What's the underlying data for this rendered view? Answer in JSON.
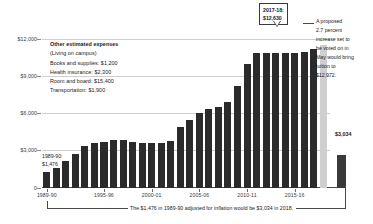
{
  "chart_data": {
    "type": "bar",
    "title": "",
    "xlabel": "",
    "ylabel": "",
    "ylim": [
      0,
      13500
    ],
    "grid": true,
    "legend_position": "none",
    "ytick_labels": [
      "0",
      "$3,000",
      "$6,000",
      "$9,000",
      "$12,000"
    ],
    "ytick_values": [
      0,
      3000,
      6000,
      9000,
      12000
    ],
    "xtick_labels": [
      "1989-90",
      "1995-96",
      "2000-01",
      "2005-06",
      "2010-11",
      "2015-16"
    ],
    "xtick_categories": [
      "1989-90",
      "1995-96",
      "2000-01",
      "2005-06",
      "2010-11",
      "2015-16"
    ],
    "categories": [
      "1989-90",
      "1990-91",
      "1991-92",
      "1992-93",
      "1993-94",
      "1994-95",
      "1995-96",
      "1996-97",
      "1997-98",
      "1998-99",
      "1999-00",
      "2000-01",
      "2001-02",
      "2002-03",
      "2003-04",
      "2004-05",
      "2005-06",
      "2006-07",
      "2007-08",
      "2008-09",
      "2009-10",
      "2010-11",
      "2011-12",
      "2012-13",
      "2013-14",
      "2014-15",
      "2015-16",
      "2016-17",
      "2017-18"
    ],
    "values": [
      1476,
      1820,
      2486,
      3044,
      3799,
      4111,
      4139,
      4354,
      4354,
      4212,
      4037,
      4047,
      4047,
      4282,
      5530,
      6141,
      6802,
      7143,
      7347,
      7788,
      9285,
      11279,
      12192,
      12192,
      12192,
      12192,
      12240,
      12294,
      12630
    ],
    "series_note": "University tuition and fees by academic year",
    "highlight_last": {
      "label_year": "2017-18",
      "label_value": "$12,630",
      "callout_text": "2017-18:\n$12,630"
    },
    "inflation_bar": {
      "label": "$3,034",
      "value": 3034,
      "description": "1989-90 tuition adjusted for inflation"
    },
    "proposed_bar": {
      "value": 12972,
      "shade": "#cfcfcf"
    },
    "annotations": [
      "A proposed 2.7 percent increase set to be voted on in May would bring tuition to $12,972.",
      "The $1,476 in 1989-90 adjusted for inflation would be $3,034 in 2018."
    ]
  },
  "callout": {
    "line1": "2017-18:",
    "line2": "$12,630"
  },
  "right_annotation": {
    "line1": "A proposed",
    "line2": "2.7 percent",
    "line3": "increase set to",
    "line4": "be voted on in",
    "line5": "May would bring",
    "line6": "tuition to",
    "line7": "$12,972."
  },
  "expenses_note": {
    "heading": "Other estimated expenses",
    "subheading": "(Living on campus)",
    "line1": "Books and supplies: $1,200",
    "line2": "Health insurance: $2,300",
    "line3": "Room and board: $15,400",
    "line4": "Transportation: $1,900"
  },
  "first_bar_label": {
    "line1": "1989-90:",
    "line2": "$1,476"
  },
  "inflation_label": {
    "value": "$3,034"
  },
  "footnote": {
    "text": "The $1,476 in 1989-90 adjusted for inflation would be $3,034 in 2018."
  },
  "colors": {
    "bar": "#2b2b2b",
    "proposed_bar": "#cfcfcf",
    "gridline": "#cfcfcf",
    "axis": "#4a4a4a",
    "text": "#1a1a1a",
    "background": "#ffffff"
  }
}
